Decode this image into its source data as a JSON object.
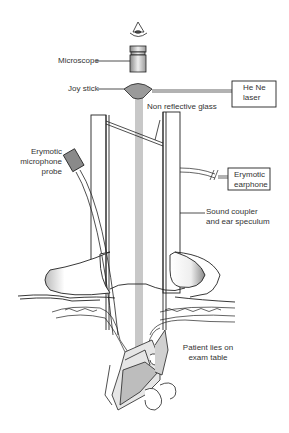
{
  "figure": {
    "type": "schematic diagram"
  },
  "labels": {
    "microscope": "Microscope",
    "joystick": "Joy stick",
    "laser_line1": "He Ne",
    "laser_line2": "laser",
    "glass": "Non reflective glass",
    "mic_line1": "Erymotic",
    "mic_line2": "microphone",
    "mic_line3": "probe",
    "earphone_line1": "Erymotic",
    "earphone_line2": "earphone",
    "coupler_line1": "Sound coupler",
    "coupler_line2": "and ear speculum",
    "patient_line1": "Patient lies on",
    "patient_line2": "exam table"
  },
  "colors": {
    "line": "#222222",
    "beam": "#c8c8c8",
    "joystick_fill": "#9a9a9a",
    "probe_fill": "#8a8a8a",
    "background": "#ffffff"
  }
}
